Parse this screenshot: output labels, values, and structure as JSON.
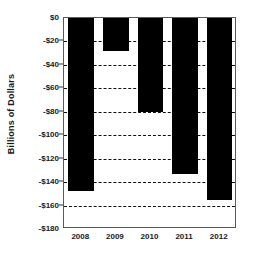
{
  "chart_data": {
    "type": "bar",
    "title": "",
    "xlabel": "",
    "ylabel": "Billions of Dollars",
    "categories": [
      "2008",
      "2009",
      "2010",
      "2011",
      "2012"
    ],
    "values": [
      -148,
      -28,
      -80,
      -133,
      -155
    ],
    "ylim": [
      -180,
      0
    ],
    "ytick_labels": [
      "$0",
      "-$20",
      "-$40",
      "-$60",
      "-$80",
      "-$100",
      "-$120",
      "-$140",
      "-$160",
      "-$180"
    ],
    "ytick_values": [
      0,
      -20,
      -40,
      -60,
      -80,
      -100,
      -120,
      -140,
      -160,
      -180
    ],
    "gridlines": [
      -20,
      -40,
      -60,
      -80,
      -100,
      -120,
      -140,
      -160
    ],
    "grid": true,
    "legend": "none",
    "bar_color": "#000000",
    "grid_color": "#111111",
    "axis_color": "#5a5a5a",
    "text_color": "#1a1a1a"
  }
}
